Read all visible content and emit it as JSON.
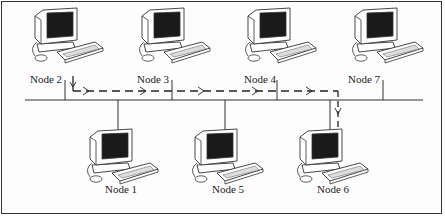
{
  "nodes_top": [
    {
      "id": "node-2",
      "label": "Node 2"
    },
    {
      "id": "node-3",
      "label": "Node 3"
    },
    {
      "id": "node-4",
      "label": "Node 4"
    },
    {
      "id": "node-7",
      "label": "Node 7"
    }
  ],
  "nodes_bottom": [
    {
      "id": "node-1",
      "label": "Node 1"
    },
    {
      "id": "node-5",
      "label": "Node 5"
    },
    {
      "id": "node-6",
      "label": "Node 6"
    }
  ],
  "message_path": {
    "from": "Node 2",
    "to": "Node 6",
    "style": "dashed-arrow"
  },
  "colors": {
    "line": "#333333",
    "screen": "#1a1a1a",
    "background": "#fdfdfd"
  }
}
